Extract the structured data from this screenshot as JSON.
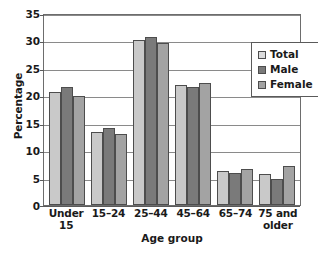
{
  "chart_data": {
    "type": "bar",
    "title": "",
    "xlabel": "Age group",
    "ylabel": "Percentage",
    "ylim": [
      0,
      35
    ],
    "ytick_step": 5,
    "yticks": [
      0,
      5,
      10,
      15,
      20,
      25,
      30,
      35
    ],
    "grid": "horizontal",
    "legend_position": "top-right-inside",
    "categories": [
      "Under 15",
      "15–24",
      "25–44",
      "45–64",
      "65–74",
      "75 and older"
    ],
    "category_lines": [
      [
        "Under 15"
      ],
      [
        "15–24"
      ],
      [
        "25–44"
      ],
      [
        "45–64"
      ],
      [
        "65–74"
      ],
      [
        "75 and",
        "older"
      ]
    ],
    "series": [
      {
        "name": "Total",
        "color": "#c9c9c9",
        "legend_color": "#dcdcdc",
        "values": [
          20.6,
          13.3,
          30.1,
          21.8,
          6.2,
          5.6
        ]
      },
      {
        "name": "Male",
        "color": "#7a7a7a",
        "legend_color": "#7a7a7a",
        "values": [
          21.5,
          14.0,
          30.7,
          21.6,
          5.8,
          4.7
        ]
      },
      {
        "name": "Female",
        "color": "#a3a3a3",
        "legend_color": "#a3a3a3",
        "values": [
          19.8,
          12.9,
          29.5,
          22.2,
          6.5,
          7.2
        ]
      }
    ]
  },
  "colors": {
    "total": "#c9c9c9",
    "male": "#7a7a7a",
    "female": "#a3a3a3",
    "bar_outline": "#4d4d4d",
    "gridline": "#8a8a8a",
    "axis": "#6d6d6d",
    "background": "#ffffff",
    "text": "#1a1a1a"
  }
}
